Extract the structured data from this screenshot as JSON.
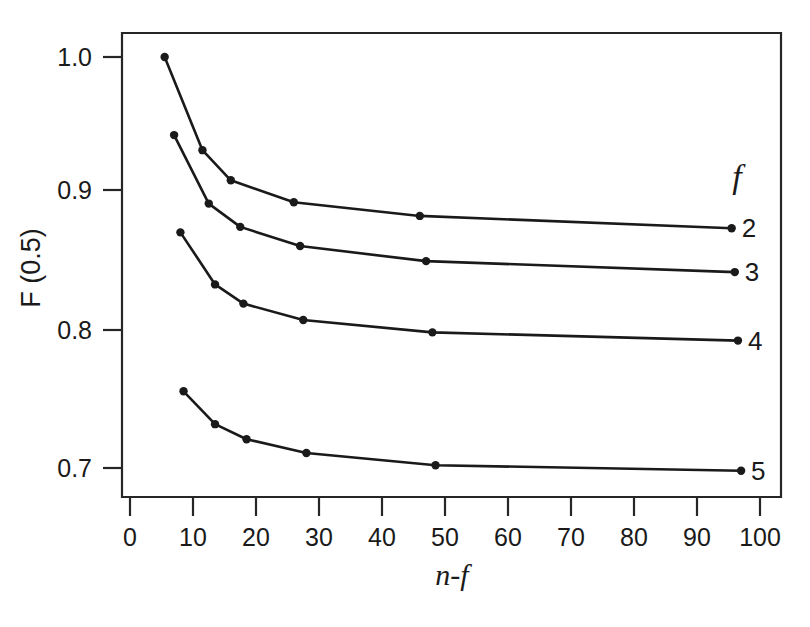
{
  "chart_data": {
    "type": "line",
    "title": "",
    "xlabel": "n-f",
    "ylabel": "F (0.5)",
    "xlim": [
      0,
      102
    ],
    "ylim": [
      0.675,
      1.02
    ],
    "grid": false,
    "legend_position": "right-inside",
    "legend_title": "f",
    "xticks": [
      0,
      10,
      20,
      30,
      40,
      50,
      60,
      70,
      80,
      90,
      100
    ],
    "xtick_labels": [
      "0",
      "10",
      "20",
      "30",
      "40",
      "50",
      "60",
      "70",
      "80",
      "90",
      "100"
    ],
    "yticks": [
      0.7,
      0.8,
      0.9,
      1.0
    ],
    "ytick_labels": [
      "0.7",
      "0.8",
      "0.9",
      "1.0"
    ],
    "series": [
      {
        "name": "2",
        "label": "2",
        "x": [
          5.5,
          11.5,
          16.0,
          26.0,
          46.0,
          95.5
        ],
        "y": [
          1.0,
          0.932,
          0.91,
          0.894,
          0.884,
          0.875
        ]
      },
      {
        "name": "3",
        "label": "3",
        "x": [
          7.0,
          12.5,
          17.5,
          27.0,
          47.0,
          96.0
        ],
        "y": [
          0.943,
          0.893,
          0.876,
          0.862,
          0.851,
          0.843
        ]
      },
      {
        "name": "4",
        "label": "4",
        "x": [
          8.0,
          13.5,
          18.0,
          27.5,
          48.0,
          96.5
        ],
        "y": [
          0.872,
          0.834,
          0.82,
          0.808,
          0.799,
          0.793
        ]
      },
      {
        "name": "5",
        "label": "5",
        "x": [
          8.5,
          13.5,
          18.5,
          28.0,
          48.5,
          97.0
        ],
        "y": [
          0.756,
          0.732,
          0.721,
          0.711,
          0.702,
          0.698
        ]
      }
    ]
  },
  "colors": {
    "line": "#1a1a1a",
    "frame": "#262626",
    "background": "#ffffff",
    "text": "#1a1a1a"
  }
}
